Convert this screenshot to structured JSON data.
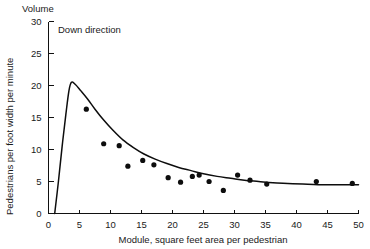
{
  "figure": {
    "header_label": "Volume",
    "annotation": "Down direction"
  },
  "chart_data": {
    "type": "scatter",
    "title": "Volume",
    "subtitle": "Down direction",
    "xlabel": "Module, square feet area per pedestrian",
    "ylabel": "Pedestrians per foot width per minute",
    "xlim": [
      0,
      50
    ],
    "ylim": [
      0,
      30
    ],
    "xticks": [
      0,
      5,
      10,
      15,
      20,
      25,
      30,
      35,
      40,
      45,
      50
    ],
    "yticks": [
      0,
      5,
      10,
      15,
      20,
      25,
      30
    ],
    "xtick_labels": [
      "0",
      "5",
      "10",
      "15",
      "20",
      "25",
      "30",
      "35",
      "40",
      "45",
      "50"
    ],
    "ytick_labels": [
      "0",
      "5",
      "10",
      "15",
      "20",
      "25",
      "30"
    ],
    "grid": false,
    "legend": false,
    "series": [
      {
        "name": "Observed data",
        "type": "scatter",
        "marker": "filled-circle",
        "color": "#0d0d0d",
        "points": [
          [
            6.1,
            16.3
          ],
          [
            8.9,
            10.9
          ],
          [
            11.4,
            10.6
          ],
          [
            12.8,
            7.4
          ],
          [
            15.2,
            8.3
          ],
          [
            17.0,
            7.6
          ],
          [
            19.3,
            5.6
          ],
          [
            21.3,
            4.9
          ],
          [
            23.2,
            5.8
          ],
          [
            24.3,
            6.0
          ],
          [
            25.9,
            5.0
          ],
          [
            28.2,
            3.6
          ],
          [
            30.5,
            6.0
          ],
          [
            32.5,
            5.2
          ],
          [
            35.2,
            4.6
          ],
          [
            43.2,
            5.0
          ],
          [
            49.0,
            4.7
          ]
        ]
      },
      {
        "name": "Fitted curve",
        "type": "line",
        "color": "#0d0d0d",
        "points": [
          [
            1.0,
            0.0
          ],
          [
            1.6,
            5.0
          ],
          [
            2.2,
            10.5
          ],
          [
            2.8,
            15.5
          ],
          [
            3.3,
            19.2
          ],
          [
            3.7,
            20.5
          ],
          [
            4.3,
            20.2
          ],
          [
            5.2,
            19.2
          ],
          [
            6.3,
            17.9
          ],
          [
            7.5,
            16.3
          ],
          [
            8.9,
            14.6
          ],
          [
            10.4,
            13.0
          ],
          [
            12.0,
            11.5
          ],
          [
            13.7,
            10.3
          ],
          [
            15.4,
            9.3
          ],
          [
            17.2,
            8.5
          ],
          [
            19.1,
            7.8
          ],
          [
            21.0,
            7.2
          ],
          [
            23.0,
            6.7
          ],
          [
            25.0,
            6.2
          ],
          [
            27.2,
            5.8
          ],
          [
            29.4,
            5.5
          ],
          [
            31.6,
            5.2
          ],
          [
            33.9,
            5.0
          ],
          [
            36.2,
            4.8
          ],
          [
            38.6,
            4.7
          ],
          [
            41.0,
            4.6
          ],
          [
            43.5,
            4.5
          ],
          [
            46.0,
            4.5
          ],
          [
            48.5,
            4.5
          ],
          [
            50.0,
            4.5
          ]
        ]
      }
    ]
  }
}
